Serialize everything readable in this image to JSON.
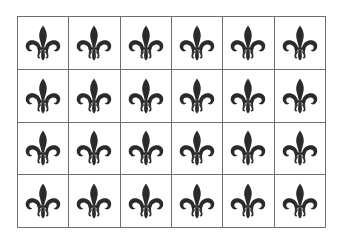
{
  "grid": {
    "rows": 4,
    "columns": 6,
    "border_color": "#6e6e6e",
    "cell_background": "#ffffff",
    "icon": "fleur-de-lis-icon",
    "icon_color": "#2b2b2b",
    "cells": [
      [
        "fleur-de-lis",
        "fleur-de-lis",
        "fleur-de-lis",
        "fleur-de-lis",
        "fleur-de-lis",
        "fleur-de-lis"
      ],
      [
        "fleur-de-lis",
        "fleur-de-lis",
        "fleur-de-lis",
        "fleur-de-lis",
        "fleur-de-lis",
        "fleur-de-lis"
      ],
      [
        "fleur-de-lis",
        "fleur-de-lis",
        "fleur-de-lis",
        "fleur-de-lis",
        "fleur-de-lis",
        "fleur-de-lis"
      ],
      [
        "fleur-de-lis",
        "fleur-de-lis",
        "fleur-de-lis",
        "fleur-de-lis",
        "fleur-de-lis",
        "fleur-de-lis"
      ]
    ]
  }
}
